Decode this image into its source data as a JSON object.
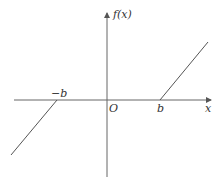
{
  "diagram": {
    "type": "function-graph",
    "axes": {
      "x_label": "x",
      "y_label": "f(x)",
      "origin_label": "O"
    },
    "x_ticks": [
      {
        "label": "-b",
        "value": "-b"
      },
      {
        "label": "b",
        "value": "b"
      }
    ],
    "segments": [
      {
        "name": "left-branch",
        "from": "(-b, 0)",
        "direction": "down-left",
        "slope": "positive"
      },
      {
        "name": "zero-segment",
        "from": "(-b, 0)",
        "to": "(b, 0)",
        "on_axis": true
      },
      {
        "name": "right-branch",
        "from": "(b, 0)",
        "direction": "up-right",
        "slope": "positive"
      }
    ],
    "colors": {
      "line": "#555555",
      "axis": "#666666",
      "text": "#333333",
      "background": "#ffffff"
    }
  },
  "labels": {
    "y_axis": "f(x)",
    "x_axis": "x",
    "origin": "O",
    "neg_b": "−b",
    "pos_b": "b"
  }
}
